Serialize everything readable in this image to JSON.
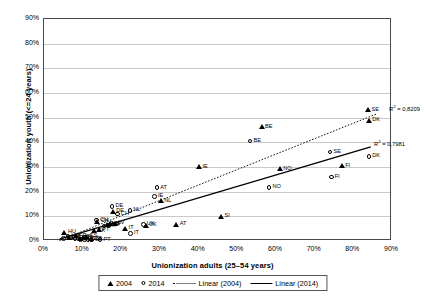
{
  "chart_data": {
    "type": "scatter",
    "title": "",
    "xlabel": "Unionization adults (25–54 years)",
    "ylabel": "Unionization youth (<=24 years)",
    "xlim": [
      0,
      90
    ],
    "ylim": [
      0,
      90
    ],
    "xticks": [
      "0%",
      "10%",
      "20%",
      "30%",
      "40%",
      "50%",
      "60%",
      "70%",
      "80%",
      "90%"
    ],
    "yticks": [
      "0%",
      "10%",
      "20%",
      "30%",
      "40%",
      "50%",
      "60%",
      "70%",
      "80%",
      "90%"
    ],
    "grid": "horizontal",
    "legend_position": "bottom",
    "series": [
      {
        "name": "2004",
        "marker": "triangle",
        "points": [
          {
            "label": "HU",
            "x": 5.3,
            "y": 3.6
          },
          {
            "label": "EE",
            "x": 6.4,
            "y": 1.2
          },
          {
            "label": "FR",
            "x": 8.2,
            "y": 2.1
          },
          {
            "label": "LT",
            "x": 9.4,
            "y": 1.0
          },
          {
            "label": "PL",
            "x": 10.2,
            "y": 1.4
          },
          {
            "label": "ES",
            "x": 11.0,
            "y": 1.8
          },
          {
            "label": "CZ",
            "x": 12.1,
            "y": 0.8
          },
          {
            "label": "SK",
            "x": 13.0,
            "y": 4.1
          },
          {
            "label": "PT",
            "x": 14.2,
            "y": 4.5
          },
          {
            "label": "CH",
            "x": 13.8,
            "y": 8.0
          },
          {
            "label": "DE",
            "x": 17.8,
            "y": 12.0
          },
          {
            "label": "GR",
            "x": 16.4,
            "y": 6.6
          },
          {
            "label": "SI",
            "x": 17.2,
            "y": 7.0
          },
          {
            "label": "LV",
            "x": 18.3,
            "y": 7.2
          },
          {
            "label": "IT",
            "x": 21.0,
            "y": 5.0
          },
          {
            "label": "UK",
            "x": 26.3,
            "y": 6.3
          },
          {
            "label": "NL",
            "x": 30.2,
            "y": 16.3
          },
          {
            "label": "AT",
            "x": 34.2,
            "y": 6.8
          },
          {
            "label": "IE",
            "x": 40.1,
            "y": 30.0
          },
          {
            "label": "SI",
            "x": 45.8,
            "y": 9.9
          },
          {
            "label": "BE",
            "x": 56.3,
            "y": 46.2
          },
          {
            "label": "NO",
            "x": 61.0,
            "y": 29.3
          },
          {
            "label": "FI",
            "x": 77.0,
            "y": 30.5
          },
          {
            "label": "SE",
            "x": 83.8,
            "y": 53.2
          },
          {
            "label": "DK",
            "x": 84.0,
            "y": 49.0
          }
        ]
      },
      {
        "name": "2014",
        "marker": "circle",
        "points": [
          {
            "label": "EE",
            "x": 5.0,
            "y": 1.0
          },
          {
            "label": "HU",
            "x": 6.2,
            "y": 2.0
          },
          {
            "label": "LT",
            "x": 7.0,
            "y": 1.5
          },
          {
            "label": "FR",
            "x": 8.0,
            "y": 1.1
          },
          {
            "label": "PL",
            "x": 9.5,
            "y": 0.5
          },
          {
            "label": "ES",
            "x": 10.5,
            "y": 0.7
          },
          {
            "label": "CZ",
            "x": 11.4,
            "y": 0.6
          },
          {
            "label": "SK",
            "x": 12.3,
            "y": 0.4
          },
          {
            "label": "PT",
            "x": 14.5,
            "y": 0.5
          },
          {
            "label": "CH",
            "x": 13.6,
            "y": 8.5
          },
          {
            "label": "GR",
            "x": 15.5,
            "y": 6.0
          },
          {
            "label": "SI",
            "x": 16.8,
            "y": 6.4
          },
          {
            "label": "LV",
            "x": 17.4,
            "y": 7.0
          },
          {
            "label": "DE",
            "x": 17.6,
            "y": 14.0
          },
          {
            "label": "CH",
            "x": 19.0,
            "y": 11.0
          },
          {
            "label": "NL",
            "x": 22.2,
            "y": 12.4
          },
          {
            "label": "IT",
            "x": 22.4,
            "y": 3.0
          },
          {
            "label": "UK",
            "x": 25.7,
            "y": 6.7
          },
          {
            "label": "IE",
            "x": 28.6,
            "y": 18.0
          },
          {
            "label": "AT",
            "x": 29.2,
            "y": 21.6
          },
          {
            "label": "BE",
            "x": 53.3,
            "y": 40.5
          },
          {
            "label": "NO",
            "x": 58.2,
            "y": 21.8
          },
          {
            "label": "FI",
            "x": 74.3,
            "y": 26.0
          },
          {
            "label": "SE",
            "x": 74.0,
            "y": 36.0
          },
          {
            "label": "DK",
            "x": 84.0,
            "y": 34.2
          }
        ]
      }
    ],
    "trendlines": [
      {
        "name": "Linear (2004)",
        "style": "dotted",
        "r2_text": "R² = 0,8209",
        "r2_value": 0.8209,
        "x0": 4.0,
        "y0": 0.2,
        "x1": 86.0,
        "y1": 51.5
      },
      {
        "name": "Linear (2014)",
        "style": "solid",
        "r2_text": "R² = 0,7981",
        "r2_value": 0.7981,
        "x0": 4.0,
        "y0": 0.8,
        "x1": 84.5,
        "y1": 38.2
      }
    ]
  },
  "legend": {
    "items": [
      {
        "label": "2004",
        "marker": "triangle"
      },
      {
        "label": "2014",
        "marker": "circle"
      },
      {
        "label": "Linear (2004)",
        "marker": "dotted-line"
      },
      {
        "label": "Linear (2014)",
        "marker": "solid-line"
      }
    ]
  }
}
